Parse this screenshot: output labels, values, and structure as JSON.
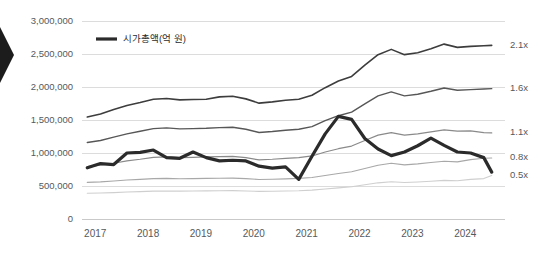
{
  "legend": {
    "position": "top-left-inside",
    "entries": [
      {
        "label": "시가총액(억 원)",
        "color": "#2b2b2b",
        "swatch": "thick-line"
      }
    ]
  },
  "axes": {
    "y": {
      "label": "",
      "min": 0,
      "max": 3000000,
      "step": 500000,
      "ticks": [
        "0",
        "500,000",
        "1,000,000",
        "1,500,000",
        "2,000,000",
        "2,500,000",
        "3,000,000"
      ]
    },
    "x": {
      "label": "",
      "ticks": [
        "2017",
        "2018",
        "2019",
        "2020",
        "2021",
        "2022",
        "2023",
        "2024"
      ]
    }
  },
  "right_axis_labels": [
    {
      "text": "2.1x",
      "value": 2630000
    },
    {
      "text": "1.6x",
      "value": 1975000
    },
    {
      "text": "1.1x",
      "value": 1305000
    },
    {
      "text": "0.8x",
      "value": 925000
    },
    {
      "text": "0.5x",
      "value": 660000
    }
  ],
  "decorations": {
    "left_arrow_icon": "chevron-right-marker"
  },
  "chart_data": {
    "type": "line",
    "title": "",
    "subtitle": "",
    "xlabel": "",
    "ylabel": "",
    "ylim": [
      0,
      3000000
    ],
    "xlim": [
      2016.75,
      2024.6
    ],
    "grid": true,
    "legend_position": "top-left",
    "x": [
      2016.85,
      2017.1,
      2017.35,
      2017.6,
      2017.85,
      2018.1,
      2018.35,
      2018.6,
      2018.85,
      2019.1,
      2019.35,
      2019.6,
      2019.85,
      2020.1,
      2020.35,
      2020.6,
      2020.85,
      2021.1,
      2021.35,
      2021.6,
      2021.85,
      2022.1,
      2022.35,
      2022.6,
      2022.85,
      2023.1,
      2023.35,
      2023.6,
      2023.85,
      2024.1,
      2024.35,
      2024.5
    ],
    "series": [
      {
        "name": "시가총액(억 원)",
        "color": "#2b2b2b",
        "width": 3.2,
        "end_label": "0.5x",
        "values": [
          775000,
          840000,
          825000,
          1000000,
          1010000,
          1045000,
          930000,
          920000,
          1015000,
          930000,
          880000,
          890000,
          880000,
          800000,
          770000,
          790000,
          600000,
          950000,
          1290000,
          1555000,
          1510000,
          1220000,
          1060000,
          960000,
          1015000,
          1110000,
          1225000,
          1115000,
          1015000,
          1000000,
          930000,
          710000
        ]
      },
      {
        "name": "2.1x band",
        "color": "#3d3d3d",
        "width": 1.6,
        "end_label": "2.1x",
        "values": [
          1545000,
          1590000,
          1660000,
          1720000,
          1765000,
          1815000,
          1825000,
          1805000,
          1810000,
          1815000,
          1850000,
          1860000,
          1820000,
          1755000,
          1775000,
          1800000,
          1815000,
          1875000,
          1990000,
          2090000,
          2160000,
          2330000,
          2490000,
          2570000,
          2490000,
          2520000,
          2580000,
          2650000,
          2600000,
          2615000,
          2625000,
          2630000
        ]
      },
      {
        "name": "1.6x band",
        "color": "#575757",
        "width": 1.4,
        "end_label": "1.6x",
        "values": [
          1160000,
          1190000,
          1240000,
          1290000,
          1330000,
          1370000,
          1380000,
          1365000,
          1370000,
          1375000,
          1385000,
          1390000,
          1360000,
          1310000,
          1325000,
          1345000,
          1360000,
          1400000,
          1490000,
          1565000,
          1620000,
          1745000,
          1865000,
          1925000,
          1865000,
          1890000,
          1935000,
          1985000,
          1950000,
          1960000,
          1970000,
          1975000
        ]
      },
      {
        "name": "1.1x band",
        "color": "#8a8a8a",
        "width": 1.2,
        "end_label": "1.1x",
        "values": [
          795000,
          815000,
          845000,
          880000,
          905000,
          935000,
          940000,
          930000,
          935000,
          940000,
          945000,
          950000,
          930000,
          895000,
          905000,
          920000,
          930000,
          955000,
          1015000,
          1065000,
          1105000,
          1190000,
          1270000,
          1310000,
          1270000,
          1290000,
          1320000,
          1350000,
          1330000,
          1335000,
          1310000,
          1305000
        ]
      },
      {
        "name": "0.8x band",
        "color": "#a8a8a8",
        "width": 1.1,
        "end_label": "0.8x",
        "values": [
          555000,
          562000,
          575000,
          590000,
          600000,
          612000,
          615000,
          610000,
          612000,
          615000,
          618000,
          620000,
          612000,
          598000,
          602000,
          608000,
          615000,
          628000,
          660000,
          690000,
          715000,
          765000,
          815000,
          845000,
          820000,
          835000,
          855000,
          875000,
          865000,
          900000,
          920000,
          925000
        ]
      },
      {
        "name": "0.5x band",
        "color": "#cfcfcf",
        "width": 1.1,
        "end_label": "",
        "values": [
          390000,
          395000,
          400000,
          408000,
          415000,
          422000,
          425000,
          422000,
          424000,
          426000,
          428000,
          430000,
          425000,
          418000,
          420000,
          424000,
          428000,
          438000,
          455000,
          472000,
          488000,
          518000,
          548000,
          565000,
          552000,
          560000,
          572000,
          585000,
          580000,
          600000,
          612000,
          660000
        ]
      }
    ]
  }
}
